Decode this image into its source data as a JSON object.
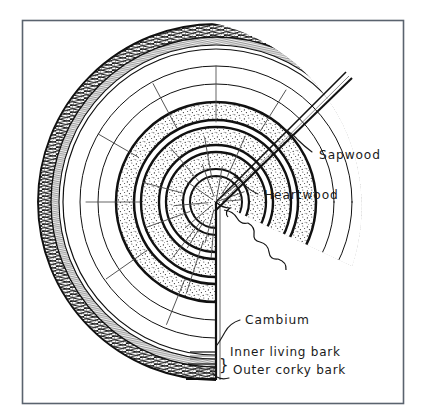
{
  "figure": {
    "kind": "hand-drawn botanical diagram",
    "frame": {
      "stroke_color": "#555f6b",
      "x": 22,
      "y": 20,
      "width": 382,
      "height": 384
    },
    "ink_color": "#1a1a1a",
    "background_color": "#ffffff"
  },
  "labels": {
    "sapwood": "Sapwood",
    "heartwood": "Heartwood",
    "cambium": "Cambium",
    "inner_living_bark": "Inner living bark",
    "outer_corky_bark": "Outer corky bark",
    "brace_glyph": "}"
  },
  "structure": {
    "center": {
      "x": 216,
      "y": 202
    },
    "cut_wedge": {
      "description": "quarter wedge removed, open to lower-right",
      "start_angle_deg": -44,
      "end_angle_deg": 90
    },
    "layers": [
      {
        "name": "outer-corky-bark",
        "fill": "dense-scribble-hatch",
        "r_outer": 178,
        "r_inner": 166
      },
      {
        "name": "inner-living-bark",
        "fill": "fine-hatch",
        "r_outer": 166,
        "r_inner": 158
      },
      {
        "name": "cambium",
        "fill": "none",
        "r_outer": 158,
        "r_inner": 154
      },
      {
        "name": "sapwood-ring-1",
        "fill": "white",
        "r_outer": 154,
        "r_inner": 136
      },
      {
        "name": "sapwood-ring-2",
        "fill": "white",
        "r_outer": 136,
        "r_inner": 118
      },
      {
        "name": "sapwood-ring-3",
        "fill": "white",
        "r_outer": 118,
        "r_inner": 100
      },
      {
        "name": "heartwood-ring-1",
        "fill": "stipple",
        "r_outer": 100,
        "r_inner": 83
      },
      {
        "name": "heartwood-ring-2",
        "fill": "stipple",
        "r_outer": 75,
        "r_inner": 58
      },
      {
        "name": "heartwood-ring-3",
        "fill": "stipple",
        "r_outer": 50,
        "r_inner": 34
      },
      {
        "name": "heartwood-pith",
        "fill": "stipple",
        "r_outer": 26,
        "r_inner": 0
      }
    ],
    "ring_count_visible": 7,
    "ray_lines": "radial medullary rays drawn as short pencil ticks"
  },
  "leaders": [
    {
      "target": "sapwood",
      "from": {
        "x": 318,
        "y": 150
      },
      "to": {
        "x": 281,
        "y": 124
      }
    },
    {
      "target": "heartwood",
      "from": {
        "x": 262,
        "y": 193
      },
      "to": {
        "x": 236,
        "y": 178
      }
    },
    {
      "target": "cambium",
      "from": {
        "x": 243,
        "y": 320
      },
      "to": {
        "x": 217,
        "y": 345
      }
    },
    {
      "target": "outer_corky_bark",
      "from": {
        "x": 232,
        "y": 376
      },
      "to": {
        "x": 214,
        "y": 370
      }
    }
  ]
}
